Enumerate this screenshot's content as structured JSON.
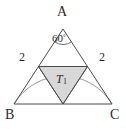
{
  "figure": {
    "kind": "geometry-diagram",
    "background_color": "#ffffff",
    "stroke_color": "#4a4a4a",
    "arc_color": "#8a8a8a",
    "shade_fill": "#d8d8d8",
    "shade_stroke": "#6a6a6a",
    "text_color": "#2b2b2b"
  },
  "vertices": {
    "apex": "A",
    "bottom_left": "B",
    "bottom_right": "C"
  },
  "measures": {
    "side_left": "2",
    "side_right": "2",
    "apex_angle_value": "60",
    "apex_angle_unit": "°"
  },
  "regions": {
    "shaded_triangle_label": "T",
    "shaded_triangle_subscript": "1"
  },
  "geometry": {
    "apex_x": 63,
    "apex_y": 29,
    "left_x": 14,
    "right_x": 112,
    "base_y": 104,
    "mid_left_x": 38.5,
    "mid_left_y": 66.5,
    "mid_right_x": 87.5,
    "mid_right_y": 66.5,
    "mid_base_x": 63,
    "mid_base_y": 104,
    "arc_radius": 57
  }
}
